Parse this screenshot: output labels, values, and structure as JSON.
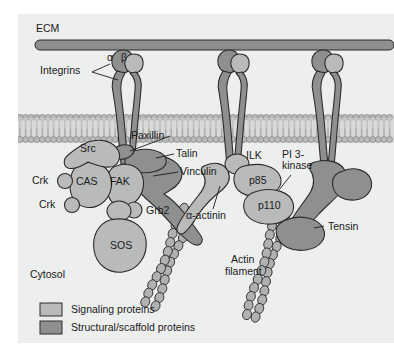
{
  "figure": {
    "background": "#edeeee",
    "outer_background": "#ffffff"
  },
  "colors": {
    "signaling": "#b9baba",
    "structural": "#8e9090",
    "ecm_bar": "#8e9090",
    "membrane_head": "#b9baba",
    "membrane_tail": "#c9caca",
    "outline": "#2b2b2b",
    "text": "#1a1a1a",
    "actin": "#b0b1b1"
  },
  "regions": {
    "ecm_label": "ECM",
    "cytosol_label": "Cytosol"
  },
  "labels": {
    "ecm": "ECM",
    "integrins": "Integrins",
    "alpha": "α",
    "beta": "β",
    "paxillin": "Paxillin",
    "talin": "Talin",
    "vinculin": "Vinculin",
    "src": "Src",
    "crk_upper": "Crk",
    "crk_lower": "Crk",
    "cas": "CAS",
    "fak": "FAK",
    "grb2": "Grb2",
    "sos": "SOS",
    "cytosol": "Cytosol",
    "alpha_actinin": "α-actinin",
    "ilk": "ILK",
    "pi3kinase_line1": "PI 3-",
    "pi3kinase_line2": "kinase",
    "p85": "p85",
    "p110": "p110",
    "tensin": "Tensin",
    "actin_line1": "Actin",
    "actin_line2": "filament"
  },
  "legend": {
    "items": [
      {
        "label": "Signaling proteins",
        "color": "#b9baba",
        "kind": "signaling"
      },
      {
        "label": "Structural/scaffold proteins",
        "color": "#8e9090",
        "kind": "structural"
      }
    ]
  }
}
